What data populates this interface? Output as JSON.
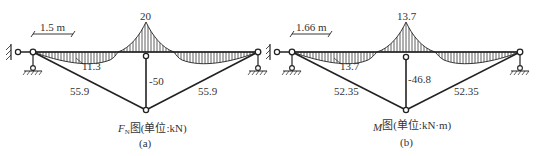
{
  "panels": [
    {
      "id": "a",
      "dimension_label": "1.5 m",
      "peak_value": "20",
      "sag_value": "11.3",
      "post_value": "-50",
      "left_strut_value": "55.9",
      "right_strut_value": "55.9",
      "caption_symbol": "F",
      "caption_subscript": "N",
      "caption_text": "图(单位:kN)",
      "sub_label": "(a)"
    },
    {
      "id": "b",
      "dimension_label": "1.66 m",
      "peak_value": "13.7",
      "sag_value": "13.7",
      "post_value": "-46.8",
      "left_strut_value": "52.35",
      "right_strut_value": "52.35",
      "caption_symbol": "M",
      "caption_subscript": "",
      "caption_text": "图(单位:kN·m)",
      "sub_label": "(b)"
    }
  ],
  "colors": {
    "line": "#222222",
    "hatch": "#333333",
    "background": "#ffffff"
  }
}
